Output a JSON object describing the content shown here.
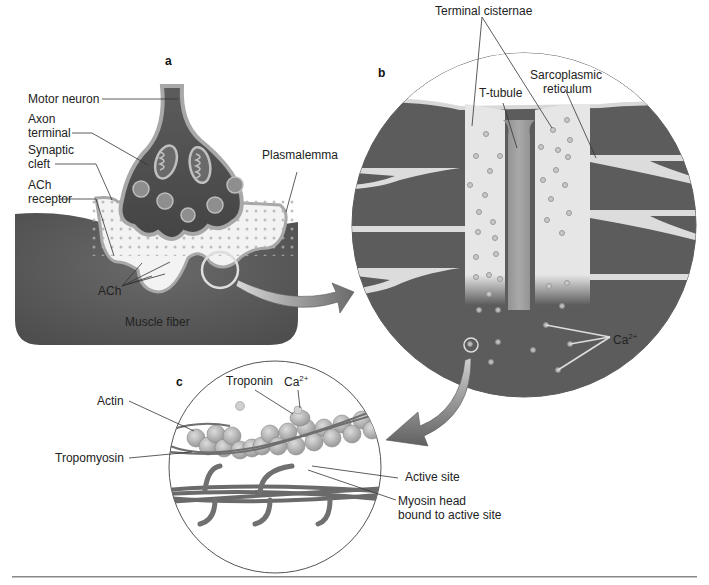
{
  "figure": {
    "panels": {
      "a": "a",
      "b": "b",
      "c": "c"
    },
    "panel_a": {
      "title": "Neuromuscular junction",
      "labels": {
        "motor_neuron": "Motor neuron",
        "axon_terminal_1": "Axon",
        "axon_terminal_2": "terminal",
        "synaptic_cleft_1": "Synaptic",
        "synaptic_cleft_2": "cleft",
        "ach_receptor_1": "ACh",
        "ach_receptor_2": "receptor",
        "plasmalemma": "Plasmalemma",
        "ach": "ACh",
        "muscle_fiber": "Muscle fiber"
      }
    },
    "panel_b": {
      "labels": {
        "terminal_cisternae": "Terminal cisternae",
        "t_tubule": "T-tubule",
        "sarcoplasmic_1": "Sarcoplasmic",
        "sarcoplasmic_2": "reticulum",
        "calcium": "Ca",
        "calcium_charge": "2+"
      }
    },
    "panel_c": {
      "labels": {
        "actin": "Actin",
        "troponin": "Troponin",
        "calcium": "Ca",
        "calcium_charge": "2+",
        "tropomyosin": "Tropomyosin",
        "active_site": "Active site",
        "myosin_head_1": "Myosin head",
        "myosin_head_2": "bound to active site"
      }
    },
    "colors": {
      "muscle_dark": "#5a5a5a",
      "membrane": "#a8a8a8",
      "cleft_light": "#f2f2f2",
      "sr_light": "#e6e6e6",
      "actin_bead": "#b8b8b8",
      "myosin": "#6e6e6e",
      "line": "#333333"
    }
  }
}
